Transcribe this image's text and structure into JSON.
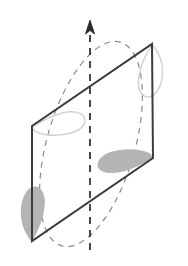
{
  "figure": {
    "canvas": {
      "width": 188,
      "height": 266,
      "background": "#ffffff"
    },
    "colors": {
      "frame_stroke": "#3c3c3c",
      "axis_stroke": "#2b2b2b",
      "orbit_stroke": "#8c8c8c",
      "blob_fill": "#b4b4b4",
      "blob_outline": "#d2d2d2",
      "background": "#ffffff"
    },
    "axis": {
      "name": "rotation-axis",
      "style": "dashed",
      "x": 90,
      "y_top": 22,
      "y_bottom": 250,
      "dash_pattern": "7 6",
      "stroke_width": 1.7,
      "arrow": {
        "name": "axis-arrowhead",
        "direction": "up",
        "tip_x": 90,
        "tip_y": 20,
        "half_width": 4.6,
        "height": 14
      }
    },
    "orbit": {
      "name": "rotation-orbit-ellipse",
      "style": "dashed",
      "center_x": 91,
      "center_y": 144,
      "radius_x": 44,
      "radius_y": 106,
      "rotation_deg": 16,
      "dash_pattern": "6 5",
      "stroke_width": 1.2
    },
    "loop": {
      "name": "quadrilateral-loop",
      "stroke_width": 2.0,
      "vertices": [
        {
          "name": "vertex-top-right",
          "x": 152,
          "y": 44
        },
        {
          "name": "vertex-right-bottom",
          "x": 153,
          "y": 158
        },
        {
          "name": "vertex-bottom-left",
          "x": 32,
          "y": 241
        },
        {
          "name": "vertex-left-top",
          "x": 32,
          "y": 126
        }
      ]
    },
    "markers": [
      {
        "name": "blob-front-bottom-left",
        "fill": "#b4b4b4",
        "shape": "teardrop-vertical",
        "anchor_x": 32,
        "anchor_y": 241,
        "orientation": "down"
      },
      {
        "name": "blob-front-bottom-right",
        "fill": "#b4b4b4",
        "shape": "teardrop-horizontal",
        "anchor_x": 153,
        "anchor_y": 158,
        "orientation": "left"
      },
      {
        "name": "blob-back-top-right",
        "outline": "#d2d2d2",
        "shape": "teardrop-vertical-outline",
        "anchor_x": 152,
        "anchor_y": 44,
        "orientation": "down"
      },
      {
        "name": "blob-back-left",
        "outline": "#d2d2d2",
        "shape": "teardrop-horizontal-outline",
        "anchor_x": 32,
        "anchor_y": 126,
        "orientation": "right"
      }
    ]
  }
}
